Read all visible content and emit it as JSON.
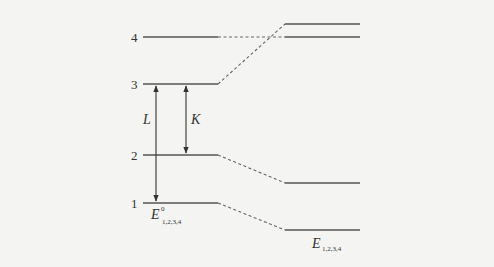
{
  "diagram": {
    "level_labels": [
      "1",
      "2",
      "3",
      "4"
    ],
    "arrow_labels": {
      "L": "L",
      "K": "K"
    },
    "unperturbed_label": {
      "main": "E",
      "sup": "0",
      "sub": "1,2,3,4"
    },
    "perturbed_label": {
      "main": "E",
      "sub": "1,2,3,4"
    },
    "colors": {
      "line": "#555555",
      "background": "#f4f4f2"
    }
  }
}
